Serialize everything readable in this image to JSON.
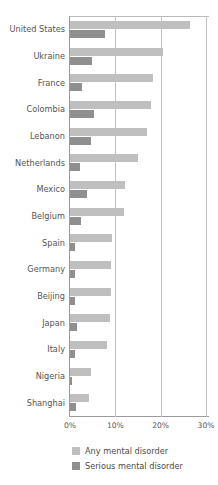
{
  "chart_data": {
    "type": "bar",
    "orientation": "horizontal",
    "title": "",
    "subtitle": "",
    "xlabel": "",
    "ylabel": "",
    "xlim": [
      0,
      30
    ],
    "xticks": [
      0,
      10,
      20,
      30
    ],
    "xtick_labels": [
      "0%",
      "10%",
      "20%",
      "30%"
    ],
    "grid": true,
    "grid_axis": "x",
    "legend_position": "bottom-left",
    "categories": [
      "United States",
      "Ukraine",
      "France",
      "Colombia",
      "Lebanon",
      "Netherlands",
      "Mexico",
      "Belgium",
      "Spain",
      "Germany",
      "Beijing",
      "Japan",
      "Italy",
      "Nigeria",
      "Shanghai"
    ],
    "series": [
      {
        "name": "Any mental disorder",
        "color": "#bfbfbf",
        "values": [
          26.4,
          20.5,
          18.4,
          17.8,
          16.9,
          14.9,
          12.2,
          12.0,
          9.2,
          9.1,
          9.1,
          8.8,
          8.2,
          4.7,
          4.3
        ]
      },
      {
        "name": "Serious mental disorder",
        "color": "#8f8f8f",
        "values": [
          7.7,
          4.8,
          2.7,
          5.2,
          4.6,
          2.3,
          3.7,
          2.4,
          1.0,
          1.2,
          1.1,
          1.5,
          1.0,
          0.4,
          1.4
        ]
      }
    ]
  },
  "legend": {
    "items": [
      {
        "label": "Any mental disorder",
        "color": "#bfbfbf"
      },
      {
        "label": "Serious mental disorder",
        "color": "#8f8f8f"
      }
    ]
  },
  "axis": {
    "tick_labels": [
      "0%",
      "10%",
      "20%",
      "30%"
    ]
  }
}
